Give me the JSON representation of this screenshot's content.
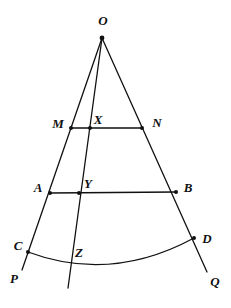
{
  "figure": {
    "background_color": "#ffffff",
    "stroke_color": "#111111",
    "stroke_width": 1.3,
    "vertex_dot_radius": 2.0,
    "width": 231,
    "height": 308
  },
  "points": {
    "O": {
      "label": "O",
      "x": 102,
      "y": 38,
      "label_x": 103,
      "label_y": 20,
      "dot": true
    },
    "M": {
      "label": "M",
      "x": 71,
      "y": 128,
      "label_x": 58,
      "label_y": 123,
      "dot": true
    },
    "X": {
      "label": "X",
      "x": 90,
      "y": 128,
      "label_x": 98,
      "label_y": 119,
      "dot": true
    },
    "N": {
      "label": "N",
      "x": 142,
      "y": 128,
      "label_x": 157,
      "label_y": 122,
      "dot": true
    },
    "A": {
      "label": "A",
      "x": 50,
      "y": 193,
      "label_x": 38,
      "label_y": 187,
      "dot": true
    },
    "Y": {
      "label": "Y",
      "x": 79,
      "y": 193,
      "label_x": 88,
      "label_y": 183,
      "dot": true
    },
    "B": {
      "label": "B",
      "x": 176,
      "y": 192,
      "label_x": 188,
      "label_y": 187,
      "dot": true
    },
    "C": {
      "label": "C",
      "x": 28,
      "y": 252,
      "label_x": 18,
      "label_y": 245,
      "dot": true
    },
    "Z": {
      "label": "Z",
      "x": 69,
      "y": 262,
      "label_x": 79,
      "label_y": 252,
      "dot": false
    },
    "D": {
      "label": "D",
      "x": 194,
      "y": 238,
      "label_x": 207,
      "label_y": 238,
      "dot": true
    },
    "P": {
      "label": "P",
      "x": 22,
      "y": 270,
      "label_x": 14,
      "label_y": 278,
      "dot": false
    },
    "Q": {
      "label": "Q",
      "x": 207,
      "y": 272,
      "label_x": 215,
      "label_y": 281,
      "dot": false
    }
  },
  "segments": [
    {
      "name": "ray-O-to-P",
      "from": "O",
      "to": "P",
      "description": "left ray of the angle through M, A and C"
    },
    {
      "name": "ray-O-to-Q",
      "from": "O",
      "to": "Q",
      "description": "right ray of the angle through N, B and D"
    },
    {
      "name": "cevian-O-through-Z",
      "from": "O",
      "to": "Z-extended",
      "x1": 102,
      "y1": 38,
      "x2": 68,
      "y2": 288,
      "description": "near-vertical line from O through X, Y, Z"
    },
    {
      "name": "chord-MN",
      "from": "M",
      "to": "N",
      "description": "upper transversal segment"
    },
    {
      "name": "chord-AB",
      "from": "A",
      "to": "B",
      "description": "lower transversal segment"
    }
  ],
  "arc": {
    "name": "arc-CD",
    "from": "C",
    "to": "D",
    "start_x": 28,
    "start_y": 252,
    "end_x": 194,
    "end_y": 238,
    "control_x": 111,
    "control_y": 283,
    "description": "curved arc from C through Z to D, sagging downward"
  },
  "labels_order": [
    "O",
    "M",
    "X",
    "N",
    "A",
    "Y",
    "B",
    "C",
    "Z",
    "D",
    "P",
    "Q"
  ]
}
